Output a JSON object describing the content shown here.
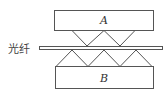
{
  "diagram": {
    "top_plate": {
      "label": "A"
    },
    "bottom_plate": {
      "label": "B"
    },
    "fiber": {
      "label": "光纤"
    },
    "colors": {
      "stroke": "#555555",
      "background": "#ffffff",
      "text": "#333333"
    }
  }
}
